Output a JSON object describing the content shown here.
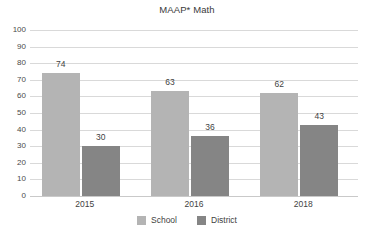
{
  "chart_data": {
    "type": "bar",
    "title": "MAAP* Math",
    "xlabel": "",
    "ylabel": "",
    "ylim": [
      0,
      100
    ],
    "ytick_step": 10,
    "yticks": [
      100,
      90,
      80,
      70,
      60,
      50,
      40,
      30,
      20,
      10,
      0
    ],
    "categories": [
      "2015",
      "2016",
      "2018"
    ],
    "grid": true,
    "legend_position": "bottom",
    "series": [
      {
        "name": "School",
        "color": "#b4b4b4",
        "values": [
          74,
          63,
          62
        ]
      },
      {
        "name": "District",
        "color": "#858585",
        "values": [
          30,
          36,
          43
        ]
      }
    ],
    "data_labels": [
      "74",
      "30",
      "63",
      "36",
      "62",
      "43"
    ]
  },
  "legend": {
    "items": [
      {
        "label": "School",
        "color": "#b4b4b4"
      },
      {
        "label": "District",
        "color": "#858585"
      }
    ]
  },
  "axis": {
    "y_labels": [
      "100",
      "90",
      "80",
      "70",
      "60",
      "50",
      "40",
      "30",
      "20",
      "10",
      "0"
    ],
    "x_labels": [
      "2015",
      "2016",
      "2018"
    ]
  },
  "colors": {
    "school": "#b4b4b4",
    "district": "#858585",
    "gridline": "#d9d9d9",
    "text": "#3f3f3f",
    "background": "#ffffff"
  }
}
